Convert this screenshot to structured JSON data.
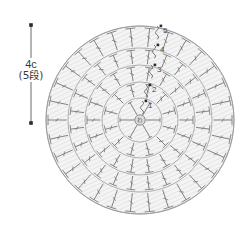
{
  "diagram": {
    "center_marker": {
      "label": "わ",
      "name": "magic-ring"
    },
    "dimension": {
      "value_label": "4c",
      "rounds_label": "(5段)",
      "line_top_y": 25,
      "line_bottom_y": 123,
      "line_x": 31
    },
    "geometry": {
      "cx": 140,
      "cy": 120,
      "outer_radius": 94,
      "ring_radii": [
        22,
        38,
        55,
        72,
        94
      ]
    },
    "colors": {
      "ring_fill": "#f0f0f0",
      "ring_stroke": "#9a9a9a",
      "stitch_stroke": "#6e6e6e",
      "hatch": "#e0e0e0",
      "text": "#3a3a3a",
      "marker": "#2a2a2a"
    },
    "rounds": [
      {
        "number": "1",
        "label_x": 148,
        "label_y": 108,
        "stitch_count": 6,
        "symbol": "single-crochet",
        "radius": 22
      },
      {
        "number": "2",
        "label_x": 152,
        "label_y": 92,
        "stitch_count": 12,
        "symbol": "double-crochet",
        "radius": 38
      },
      {
        "number": "3",
        "label_x": 157,
        "label_y": 72,
        "stitch_count": 18,
        "symbol": "double-crochet",
        "radius": 55
      },
      {
        "number": "4",
        "label_x": 160,
        "label_y": 52,
        "stitch_count": 24,
        "symbol": "double-crochet",
        "radius": 72
      },
      {
        "number": "5",
        "label_x": 163,
        "label_y": 33,
        "stitch_count": 30,
        "symbol": "double-crochet",
        "radius": 94
      }
    ],
    "chain_start_markers": [
      {
        "round": "1",
        "x": 142,
        "y": 104
      },
      {
        "round": "2",
        "x": 146,
        "y": 88
      },
      {
        "round": "3",
        "x": 151,
        "y": 68
      },
      {
        "round": "4",
        "x": 154,
        "y": 48
      },
      {
        "round": "5",
        "x": 157,
        "y": 29
      }
    ]
  }
}
